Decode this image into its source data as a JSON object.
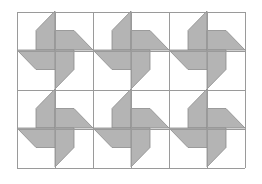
{
  "diagram": {
    "title": "",
    "type": "pinwheel-tessellation",
    "grid": {
      "x": 17,
      "y": 12,
      "cols": 6,
      "rows": 4,
      "cell_w": 38,
      "cell_h": 39
    },
    "colors": {
      "background": "#ffffff",
      "fill": "#b4b4b4",
      "stroke": "#8c8c8c",
      "grid": "#9a9a9a"
    },
    "pinwheels": [
      {
        "cx": 55,
        "cy": 50
      },
      {
        "cx": 131,
        "cy": 50
      },
      {
        "cx": 207,
        "cy": 50
      },
      {
        "cx": 55,
        "cy": 128
      },
      {
        "cx": 131,
        "cy": 128
      },
      {
        "cx": 207,
        "cy": 128
      }
    ]
  }
}
